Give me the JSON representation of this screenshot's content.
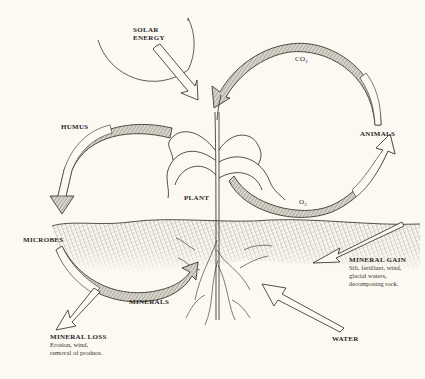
{
  "diagram": {
    "type": "nutrient cycle illustration",
    "colors": {
      "background": "#fbf9f2",
      "ink": "#2a2622",
      "shaded_arrow": "#9a958c",
      "soil": "#8a857c"
    },
    "labels": {
      "solar_energy_line1": "SOLAR",
      "solar_energy_line2": "ENERGY",
      "co2": "CO",
      "co2_sub": "2",
      "humus": "HUMUS",
      "animals": "ANIMALS",
      "plant": "PLANT",
      "o2": "O",
      "o2_sub": "2",
      "microbes": "MICROBES",
      "mineral_gain": "MINERAL GAIN",
      "mineral_gain_desc_1": "Silt, fertilizer, wind,",
      "mineral_gain_desc_2": "glacial waters,",
      "mineral_gain_desc_3": "decomposing rock.",
      "minerals": "MINERALS",
      "mineral_loss": "MINERAL LOSS",
      "mineral_loss_desc_1": "Erosion, wind,",
      "mineral_loss_desc_2": "removal of produce.",
      "water": "WATER"
    },
    "flows": [
      {
        "from": "SOLAR ENERGY",
        "to": "PLANT"
      },
      {
        "from": "ANIMALS",
        "to": "PLANT",
        "label": "CO2"
      },
      {
        "from": "PLANT",
        "to": "ANIMALS",
        "label": "O2"
      },
      {
        "from": "PLANT",
        "to": "MICROBES",
        "label": "HUMUS"
      },
      {
        "from": "MICROBES",
        "to": "PLANT",
        "label": "MINERALS"
      },
      {
        "from": "SOIL",
        "to": "outside",
        "label": "MINERAL LOSS"
      },
      {
        "from": "outside",
        "to": "SOIL",
        "label": "MINERAL GAIN"
      },
      {
        "from": "WATER",
        "to": "PLANT roots"
      }
    ]
  }
}
